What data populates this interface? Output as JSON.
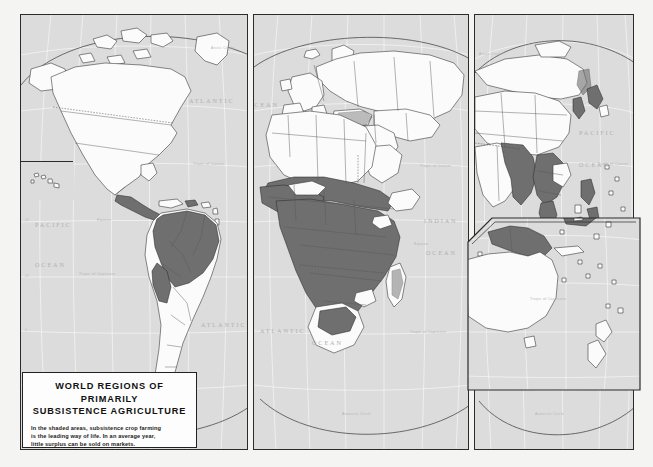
{
  "map": {
    "title_line_1": "WORLD REGIONS OF PRIMARILY",
    "title_line_2": "SUBSISTENCE AGRICULTURE",
    "caption_line_1": "In the shaded areas, subsistence crop farming",
    "caption_line_2": "is the leading way of life. In an average year,",
    "caption_line_3": "little surplus can be sold on markets.",
    "colors": {
      "shaded_region": "#6f6f6f",
      "ocean": "#dcdcdc",
      "land": "#fbfbfb",
      "frame": "#2b2b2b",
      "graticule": "#ffffff",
      "page_background": "#f4f4f2"
    }
  },
  "panels": [
    {
      "id": "americas",
      "name": "Americas panel"
    },
    {
      "id": "afroeurasia",
      "name": "Africa and Eurasia panel"
    },
    {
      "id": "asiapacific",
      "name": "Asia Pacific panel"
    },
    {
      "id": "oceania",
      "name": "Oceania inset panel"
    },
    {
      "id": "hawaii",
      "name": "Hawaii inset box"
    }
  ],
  "labels": {
    "oceans": {
      "pacific_west_1": "PACIFIC",
      "pacific_west_2": "OCEAN",
      "atlantic_north": "ATLANTIC",
      "atlantic_mid": "OCEAN",
      "atlantic_south_1": "ATLANTIC",
      "atlantic_south_2": "OCEAN",
      "indian_1": "INDIAN",
      "indian_2": "OCEAN",
      "pacific_east_1": "PACIFIC",
      "pacific_east_2": "OCEAN"
    },
    "latitudes": {
      "arctic_circle": "Arctic Circle",
      "tropic_of_cancer": "Tropic of Cancer",
      "equator": "Equator",
      "tropic_of_capricorn": "Tropic of Capricorn",
      "antarctic_circle": "Antarctic Circle"
    },
    "graticule_degrees": [
      "60°",
      "40°",
      "20°",
      "0°",
      "20°",
      "40°"
    ]
  },
  "legend": {
    "shaded_meaning": "Regions of primarily subsistence agriculture"
  }
}
